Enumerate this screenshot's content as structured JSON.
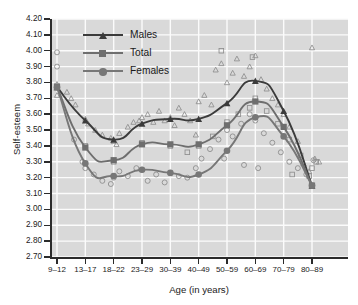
{
  "chart_data": {
    "type": "line",
    "title": "",
    "xlabel": "Age (in years)",
    "ylabel": "Self-esteem",
    "categories": [
      "9–12",
      "13–17",
      "18–22",
      "23–29",
      "30–39",
      "40–49",
      "50–59",
      "60–69",
      "70–79",
      "80–89"
    ],
    "ylim": [
      2.7,
      4.2
    ],
    "ytick_labels": [
      "2.70",
      "2.80",
      "2.90",
      "3.00",
      "3.10",
      "3.20",
      "3.30",
      "3.40",
      "3.50",
      "3.60",
      "3.70",
      "3.80",
      "3.90",
      "4.00",
      "4.10",
      "4.20"
    ],
    "grid": true,
    "legend_position": "top-left",
    "series": [
      {
        "name": "Males",
        "marker": "triangle",
        "color": "#3b3b3b",
        "values": [
          3.77,
          3.56,
          3.44,
          3.54,
          3.57,
          3.57,
          3.67,
          3.81,
          3.62,
          3.15
        ]
      },
      {
        "name": "Total",
        "marker": "square",
        "color": "#6e6e6e",
        "values": [
          3.77,
          3.39,
          3.31,
          3.41,
          3.41,
          3.41,
          3.53,
          3.68,
          3.52,
          3.15
        ]
      },
      {
        "name": "Females",
        "marker": "circle",
        "color": "#777777",
        "values": [
          3.77,
          3.29,
          3.21,
          3.25,
          3.23,
          3.22,
          3.37,
          3.58,
          3.46,
          3.15
        ]
      }
    ],
    "scatter": {
      "description": "Open markers show individual study estimates",
      "Males": [
        [
          0,
          3.77
        ],
        [
          0,
          3.79
        ],
        [
          0,
          3.72
        ],
        [
          0.35,
          3.74
        ],
        [
          0.5,
          3.7
        ],
        [
          0.65,
          3.66
        ],
        [
          1,
          3.57
        ],
        [
          1.1,
          3.54
        ],
        [
          1.35,
          3.5
        ],
        [
          1.6,
          3.47
        ],
        [
          1.9,
          3.45
        ],
        [
          2,
          3.43
        ],
        [
          2.1,
          3.41
        ],
        [
          2.2,
          3.48
        ],
        [
          2.5,
          3.52
        ],
        [
          2.7,
          3.55
        ],
        [
          2.9,
          3.56
        ],
        [
          3,
          3.58
        ],
        [
          3.2,
          3.6
        ],
        [
          3.4,
          3.55
        ],
        [
          3.6,
          3.62
        ],
        [
          3.8,
          3.56
        ],
        [
          4,
          3.58
        ],
        [
          4.15,
          3.53
        ],
        [
          4.3,
          3.64
        ],
        [
          4.5,
          3.6
        ],
        [
          4.7,
          3.56
        ],
        [
          4.9,
          3.47
        ],
        [
          5,
          3.68
        ],
        [
          5.2,
          3.72
        ],
        [
          5.45,
          3.66
        ],
        [
          5.6,
          3.88
        ],
        [
          5.8,
          3.92
        ],
        [
          6,
          3.8
        ],
        [
          6.2,
          3.86
        ],
        [
          6.35,
          3.95
        ],
        [
          6.6,
          3.84
        ],
        [
          6.8,
          3.9
        ],
        [
          7,
          3.97
        ],
        [
          7.2,
          3.82
        ],
        [
          7.4,
          3.76
        ],
        [
          7.6,
          3.7
        ],
        [
          7.8,
          3.66
        ],
        [
          8,
          3.6
        ],
        [
          8.2,
          3.52
        ],
        [
          8.5,
          3.43
        ],
        [
          8.7,
          3.29
        ],
        [
          8.9,
          3.24
        ],
        [
          9,
          4.02
        ],
        [
          9.1,
          3.32
        ],
        [
          9.25,
          3.3
        ]
      ],
      "Total": [
        [
          0,
          3.78
        ],
        [
          1,
          3.4
        ],
        [
          2,
          3.3
        ],
        [
          3,
          3.42
        ],
        [
          4,
          3.4
        ],
        [
          4.6,
          3.36
        ],
        [
          5,
          3.4
        ],
        [
          5.5,
          3.46
        ],
        [
          6,
          3.55
        ],
        [
          6.4,
          3.6
        ],
        [
          6.8,
          3.64
        ],
        [
          7,
          3.7
        ],
        [
          7.4,
          3.62
        ],
        [
          7.8,
          3.54
        ],
        [
          8.2,
          3.44
        ],
        [
          8.6,
          3.34
        ],
        [
          9,
          3.26
        ],
        [
          9.15,
          3.3
        ],
        [
          5.8,
          4.0
        ],
        [
          6.9,
          3.96
        ],
        [
          8.3,
          3.22
        ],
        [
          8.9,
          3.21
        ]
      ],
      "Females": [
        [
          0,
          3.99
        ],
        [
          0,
          3.9
        ],
        [
          0,
          3.77
        ],
        [
          0.6,
          3.44
        ],
        [
          0.9,
          3.3
        ],
        [
          1,
          3.26
        ],
        [
          1.3,
          3.22
        ],
        [
          1.6,
          3.18
        ],
        [
          1.9,
          3.16
        ],
        [
          2,
          3.2
        ],
        [
          2.2,
          3.24
        ],
        [
          2.5,
          3.21
        ],
        [
          2.8,
          3.26
        ],
        [
          3,
          3.25
        ],
        [
          3.2,
          3.18
        ],
        [
          3.5,
          3.22
        ],
        [
          3.8,
          3.17
        ],
        [
          4,
          3.23
        ],
        [
          4.3,
          3.21
        ],
        [
          4.6,
          3.2
        ],
        [
          4.9,
          3.26
        ],
        [
          5.1,
          3.32
        ],
        [
          5.4,
          3.38
        ],
        [
          5.7,
          3.44
        ],
        [
          6,
          3.5
        ],
        [
          6.2,
          3.46
        ],
        [
          6.5,
          3.54
        ],
        [
          6.8,
          3.6
        ],
        [
          7,
          3.56
        ],
        [
          7.3,
          3.48
        ],
        [
          7.6,
          3.42
        ],
        [
          7.9,
          3.36
        ],
        [
          8.2,
          3.3
        ],
        [
          8.5,
          3.26
        ],
        [
          8.8,
          3.22
        ],
        [
          9.05,
          3.31
        ],
        [
          5.9,
          3.32
        ],
        [
          6.6,
          3.28
        ],
        [
          7.1,
          3.26
        ]
      ]
    }
  },
  "legend": {
    "items": [
      {
        "label": "Males"
      },
      {
        "label": "Total"
      },
      {
        "label": "Females"
      }
    ]
  }
}
